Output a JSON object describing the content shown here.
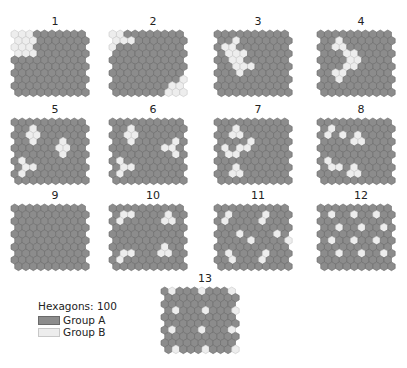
{
  "colors": {
    "group_a": "#8c8c8c",
    "group_a_stroke": "#6a6a6a",
    "group_b": "#ededed",
    "group_b_stroke": "#c8c8c8"
  },
  "grid": {
    "rows": 10,
    "cols": 10
  },
  "panels": [
    {
      "label": "1",
      "x": 10,
      "y": 16,
      "b": [
        [
          0,
          0
        ],
        [
          0,
          1
        ],
        [
          0,
          2
        ],
        [
          1,
          0
        ],
        [
          1,
          1
        ],
        [
          1,
          2
        ],
        [
          2,
          0
        ],
        [
          2,
          1
        ],
        [
          2,
          2
        ],
        [
          3,
          0
        ],
        [
          3,
          1
        ],
        [
          3,
          2
        ]
      ]
    },
    {
      "label": "2",
      "x": 108,
      "y": 16,
      "b": [
        [
          0,
          0
        ],
        [
          0,
          1
        ],
        [
          1,
          0
        ],
        [
          1,
          1
        ],
        [
          1,
          2
        ],
        [
          2,
          0
        ],
        [
          8,
          9
        ],
        [
          8,
          8
        ],
        [
          9,
          7
        ],
        [
          9,
          8
        ],
        [
          9,
          9
        ],
        [
          7,
          9
        ]
      ]
    },
    {
      "label": "3",
      "x": 213,
      "y": 16,
      "b": [
        [
          1,
          2
        ],
        [
          2,
          1
        ],
        [
          2,
          2
        ],
        [
          3,
          1
        ],
        [
          3,
          2
        ],
        [
          3,
          3
        ],
        [
          4,
          2
        ],
        [
          4,
          3
        ],
        [
          5,
          2
        ],
        [
          5,
          3
        ],
        [
          5,
          4
        ],
        [
          6,
          3
        ]
      ]
    },
    {
      "label": "4",
      "x": 316,
      "y": 16,
      "b": [
        [
          1,
          2
        ],
        [
          2,
          2
        ],
        [
          2,
          3
        ],
        [
          3,
          3
        ],
        [
          3,
          4
        ],
        [
          4,
          4
        ],
        [
          4,
          5
        ],
        [
          5,
          3
        ],
        [
          5,
          4
        ],
        [
          6,
          2
        ],
        [
          6,
          3
        ],
        [
          7,
          2
        ]
      ]
    },
    {
      "label": "5",
      "x": 10,
      "y": 104,
      "b": [
        [
          1,
          2
        ],
        [
          2,
          2
        ],
        [
          2,
          3
        ],
        [
          3,
          2
        ],
        [
          3,
          6
        ],
        [
          4,
          6
        ],
        [
          4,
          7
        ],
        [
          5,
          6
        ],
        [
          6,
          1
        ],
        [
          7,
          1
        ],
        [
          7,
          2
        ],
        [
          8,
          1
        ]
      ]
    },
    {
      "label": "6",
      "x": 108,
      "y": 104,
      "b": [
        [
          1,
          2
        ],
        [
          2,
          2
        ],
        [
          2,
          3
        ],
        [
          3,
          2
        ],
        [
          3,
          8
        ],
        [
          4,
          7
        ],
        [
          4,
          8
        ],
        [
          5,
          8
        ],
        [
          6,
          1
        ],
        [
          7,
          1
        ],
        [
          7,
          2
        ],
        [
          8,
          1
        ]
      ]
    },
    {
      "label": "7",
      "x": 213,
      "y": 104,
      "b": [
        [
          1,
          2
        ],
        [
          2,
          2
        ],
        [
          2,
          3
        ],
        [
          3,
          4
        ],
        [
          4,
          3
        ],
        [
          4,
          4
        ],
        [
          4,
          1
        ],
        [
          5,
          1
        ],
        [
          5,
          2
        ],
        [
          7,
          2
        ],
        [
          8,
          2
        ],
        [
          8,
          3
        ]
      ]
    },
    {
      "label": "8",
      "x": 316,
      "y": 104,
      "b": [
        [
          1,
          1
        ],
        [
          2,
          1
        ],
        [
          2,
          3
        ],
        [
          2,
          5
        ],
        [
          3,
          4
        ],
        [
          3,
          5
        ],
        [
          6,
          1
        ],
        [
          7,
          1
        ],
        [
          7,
          2
        ],
        [
          7,
          4
        ],
        [
          8,
          4
        ],
        [
          8,
          5
        ]
      ]
    },
    {
      "label": "9",
      "x": 10,
      "y": 190,
      "b": []
    },
    {
      "label": "10",
      "x": 108,
      "y": 190,
      "b": [
        [
          1,
          1
        ],
        [
          1,
          2
        ],
        [
          2,
          1
        ],
        [
          1,
          7
        ],
        [
          2,
          7
        ],
        [
          2,
          8
        ],
        [
          6,
          7
        ],
        [
          7,
          6
        ],
        [
          7,
          7
        ],
        [
          7,
          1
        ],
        [
          7,
          2
        ],
        [
          8,
          1
        ]
      ]
    },
    {
      "label": "11",
      "x": 213,
      "y": 190,
      "b": [
        [
          1,
          1
        ],
        [
          2,
          1
        ],
        [
          1,
          6
        ],
        [
          2,
          6
        ],
        [
          4,
          3
        ],
        [
          5,
          4
        ],
        [
          4,
          8
        ],
        [
          5,
          9
        ],
        [
          7,
          1
        ],
        [
          8,
          2
        ],
        [
          7,
          6
        ],
        [
          8,
          6
        ]
      ]
    },
    {
      "label": "12",
      "x": 316,
      "y": 190,
      "b": [
        [
          1,
          1
        ],
        [
          1,
          4
        ],
        [
          1,
          7
        ],
        [
          3,
          2
        ],
        [
          3,
          5
        ],
        [
          3,
          8
        ],
        [
          5,
          1
        ],
        [
          5,
          4
        ],
        [
          5,
          7
        ],
        [
          7,
          2
        ],
        [
          7,
          5
        ],
        [
          7,
          8
        ]
      ]
    },
    {
      "label": "13",
      "x": 160,
      "y": 273,
      "b": [
        [
          0,
          1
        ],
        [
          0,
          5
        ],
        [
          0,
          9
        ],
        [
          3,
          1
        ],
        [
          3,
          5
        ],
        [
          3,
          9
        ],
        [
          6,
          1
        ],
        [
          6,
          5
        ],
        [
          6,
          9
        ],
        [
          9,
          1
        ],
        [
          9,
          5
        ],
        [
          9,
          9
        ]
      ]
    }
  ],
  "legend": {
    "title": "Hexagons: 100",
    "items": [
      {
        "label": "Group A",
        "key": "group_a"
      },
      {
        "label": "Group B",
        "key": "group_b"
      }
    ]
  }
}
